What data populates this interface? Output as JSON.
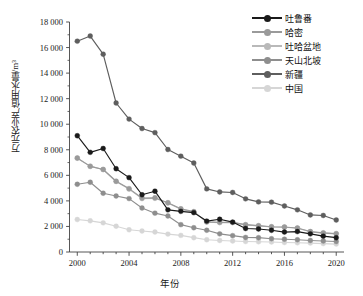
{
  "chart_data": {
    "type": "line",
    "title": "",
    "xlabel": "年份",
    "ylabel": "万元农业产值用水量/m³",
    "grid": false,
    "legend_position": "top-right",
    "xlim": [
      1999.4,
      2020.6
    ],
    "ylim": [
      0,
      18000
    ],
    "x": [
      2000,
      2001,
      2002,
      2003,
      2004,
      2005,
      2006,
      2007,
      2008,
      2009,
      2010,
      2011,
      2012,
      2013,
      2014,
      2015,
      2016,
      2017,
      2018,
      2019,
      2020
    ],
    "xticks": [
      2000,
      2004,
      2008,
      2012,
      2016,
      2020
    ],
    "xtick_labels": [
      "2000",
      "2004",
      "2008",
      "2012",
      "2016",
      "2020"
    ],
    "yticks": [
      0,
      2000,
      4000,
      6000,
      8000,
      10000,
      12000,
      14000,
      16000,
      18000
    ],
    "ytick_labels": [
      "0",
      "2 000",
      "4 000",
      "6 000",
      "8 000",
      "10 000",
      "12 000",
      "14 000",
      "16 000",
      "18 000"
    ],
    "series": [
      {
        "name": "吐鲁番",
        "color": "#1a1a1a",
        "marker": "circle",
        "values": [
          9100,
          7800,
          8100,
          6520,
          5820,
          4480,
          4760,
          3300,
          3180,
          3080,
          2420,
          2560,
          2340,
          1840,
          1800,
          1700,
          1560,
          1600,
          1420,
          1240,
          1120
        ]
      },
      {
        "name": "哈密",
        "color": "#9a9a9a",
        "marker": "circle",
        "values": [
          7360,
          6700,
          6460,
          5540,
          4960,
          4220,
          4240,
          3860,
          3380,
          3160,
          2360,
          2320,
          2320,
          2140,
          2060,
          1980,
          1960,
          1880,
          1600,
          1500,
          1440
        ]
      },
      {
        "name": "吐哈盆地",
        "color": "#b9b9b9",
        "marker": "circle",
        "values": [
          7340,
          6720,
          6460,
          5520,
          4920,
          4180,
          4200,
          3840,
          3340,
          3140,
          2340,
          2300,
          2300,
          2120,
          2040,
          1960,
          1940,
          1860,
          1580,
          1480,
          1420
        ]
      },
      {
        "name": "天山北坡",
        "color": "#8e8e8e",
        "marker": "circle",
        "values": [
          5300,
          5460,
          4600,
          4380,
          4180,
          3440,
          3040,
          2820,
          2140,
          1900,
          1700,
          1420,
          1280,
          1140,
          1120,
          1040,
          1000,
          960,
          900,
          860,
          820
        ]
      },
      {
        "name": "新疆",
        "color": "#5e5e5e",
        "marker": "circle",
        "values": [
          16500,
          16900,
          15480,
          11660,
          10400,
          9660,
          9340,
          8020,
          7500,
          6960,
          4940,
          4700,
          4660,
          4160,
          3920,
          3900,
          3600,
          3300,
          2900,
          2860,
          2500
        ]
      },
      {
        "name": "中国",
        "color": "#d6d6d6",
        "marker": "circle",
        "values": [
          2540,
          2440,
          2280,
          2020,
          1740,
          1640,
          1560,
          1400,
          1300,
          1120,
          960,
          900,
          860,
          820,
          800,
          780,
          740,
          720,
          700,
          660,
          620
        ]
      }
    ]
  },
  "axes": {
    "y_title": "万元农业产值用水量/m³",
    "x_title": "年份"
  }
}
